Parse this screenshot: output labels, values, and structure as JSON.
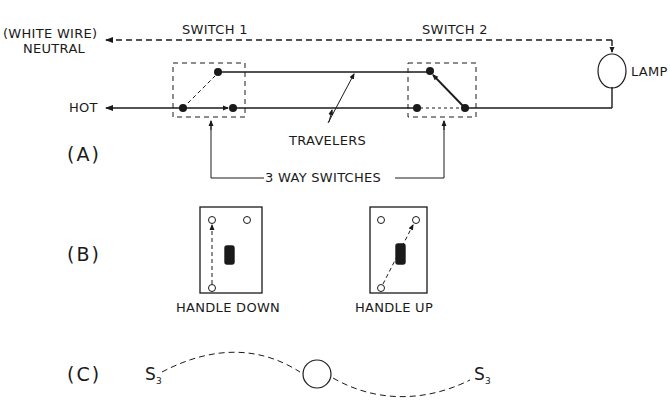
{
  "diagram": {
    "type": "wiring",
    "section_a": {
      "label": "(A)",
      "neutral_label_line1": "(WHITE WIRE)",
      "neutral_label_line2": "NEUTRAL",
      "hot_label": "HOT",
      "switch1_label": "SWITCH 1",
      "switch2_label": "SWITCH 2",
      "lamp_label": "LAMP",
      "travelers_label": "TRAVELERS",
      "three_way_label": "3 WAY SWITCHES"
    },
    "section_b": {
      "label": "(B)",
      "plate_left_caption": "HANDLE DOWN",
      "plate_right_caption": "HANDLE UP"
    },
    "section_c": {
      "label": "(C)",
      "symbol_left": "S",
      "symbol_left_sub": "3",
      "symbol_right": "S",
      "symbol_right_sub": "3"
    },
    "colors": {
      "line": "#1a1a1a",
      "background": "#ffffff"
    }
  }
}
